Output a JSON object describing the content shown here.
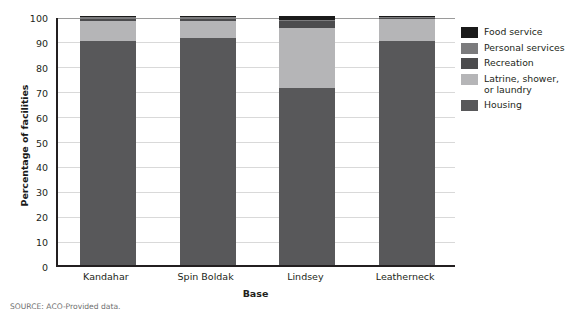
{
  "chart_data": {
    "type": "bar",
    "subtype": "stacked-column-100",
    "title": "",
    "xlabel": "Base",
    "ylabel": "Percentage of facilities",
    "categories": [
      "Kandahar",
      "Spin Boldak",
      "Lindsey",
      "Leatherneck"
    ],
    "ylim": [
      0,
      100
    ],
    "yticks": [
      0,
      10,
      20,
      30,
      40,
      50,
      60,
      70,
      80,
      90,
      100
    ],
    "grid": "horizontal",
    "legend_position": "right",
    "stack_order_bottom_to_top": [
      "Housing",
      "Latrine, shower, or laundry",
      "Recreation",
      "Personal services",
      "Food service"
    ],
    "series": [
      {
        "name": "Housing",
        "color": "#58585a",
        "values": [
          90,
          91,
          71,
          90
        ]
      },
      {
        "name": "Latrine, shower, or laundry",
        "color": "#b5b5b7",
        "values": [
          8,
          7,
          24,
          9
        ]
      },
      {
        "name": "Recreation",
        "color": "#4c4c4e",
        "values": [
          1,
          1,
          3,
          0.6
        ]
      },
      {
        "name": "Personal services",
        "color": "#7b7b7d",
        "values": [
          0.6,
          0.6,
          0.4,
          0.2
        ]
      },
      {
        "name": "Food service",
        "color": "#1a1a1a",
        "values": [
          0.4,
          0.4,
          1.6,
          0.2
        ]
      }
    ]
  },
  "legend": {
    "items": [
      {
        "label": "Food service",
        "color": "#1a1a1a"
      },
      {
        "label": "Personal services",
        "color": "#7b7b7d"
      },
      {
        "label": "Recreation",
        "color": "#4c4c4e"
      },
      {
        "label": "Latrine, shower,\nor laundry",
        "color": "#b5b5b7"
      },
      {
        "label": "Housing",
        "color": "#58585a"
      }
    ]
  },
  "source_note": "SOURCE: ACO-Provided data."
}
